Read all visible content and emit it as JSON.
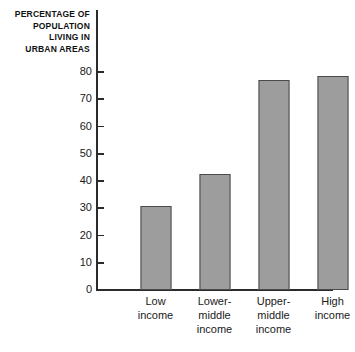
{
  "chart_data": {
    "type": "bar",
    "title": "PERCENTAGE OF POPULATION LIVING IN URBAN AREAS",
    "title_lines": [
      "PERCENTAGE OF",
      "POPULATION",
      "LIVING IN",
      "URBAN AREAS"
    ],
    "categories": [
      "Low income",
      "Lower-middle income",
      "Upper-middle income",
      "High income"
    ],
    "category_lines": [
      [
        "Low",
        "income"
      ],
      [
        "Lower-",
        "middle",
        "income"
      ],
      [
        "Upper-",
        "middle",
        "income"
      ],
      [
        "High",
        "income"
      ]
    ],
    "values": [
      30.8,
      42.5,
      77.0,
      78.5
    ],
    "xlabel": "",
    "ylabel": "",
    "ylim": [
      0,
      80
    ],
    "yticks": [
      0,
      10,
      20,
      30,
      40,
      50,
      60,
      70,
      80
    ],
    "ytick_labels": [
      "0",
      "10",
      "20",
      "30",
      "40",
      "50",
      "60",
      "70",
      "80"
    ],
    "grid": false,
    "legend": null,
    "bar_color": "#9d9d9d",
    "bar_border_color": "#4a4a4a",
    "axis_color": "#2b2b2b",
    "background_color": "#ffffff"
  }
}
